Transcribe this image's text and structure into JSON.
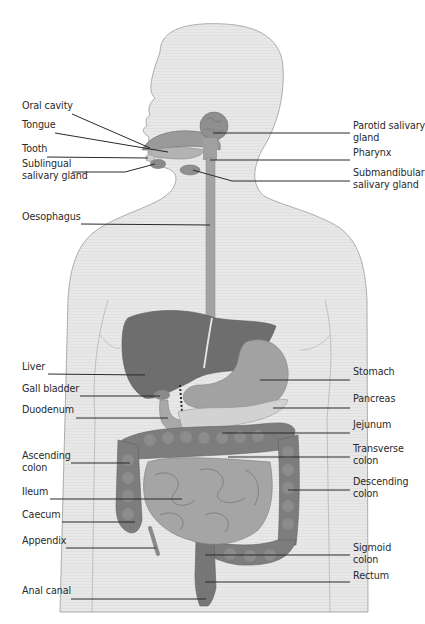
{
  "colors": {
    "background": "#ffffff",
    "body_silhouette": "#e6e6e6",
    "body_outline": "#9a9a9a",
    "organ_dark": "#6a6a6a",
    "organ_mid": "#8c8c8c",
    "organ_light": "#b0b0b0",
    "leader_line": "#2a2a2a",
    "label_text": "#2a2a2a"
  },
  "labels_left": [
    {
      "id": "oral-cavity",
      "text": "Oral cavity",
      "line2": "",
      "x": 22,
      "y": 108
    },
    {
      "id": "tongue",
      "text": "Tongue",
      "line2": "",
      "x": 22,
      "y": 127
    },
    {
      "id": "tooth",
      "text": "Tooth",
      "line2": "",
      "x": 22,
      "y": 151
    },
    {
      "id": "sublingual-salivary-gland",
      "text": "Sublingual",
      "line2": "salivary gland",
      "x": 22,
      "y": 166
    },
    {
      "id": "oesophagus",
      "text": "Oesophagus",
      "line2": "",
      "x": 22,
      "y": 219
    },
    {
      "id": "liver",
      "text": "Liver",
      "line2": "",
      "x": 22,
      "y": 369
    },
    {
      "id": "gall-bladder",
      "text": "Gall bladder",
      "line2": "",
      "x": 22,
      "y": 391
    },
    {
      "id": "duodenum",
      "text": "Duodenum",
      "line2": "",
      "x": 22,
      "y": 412
    },
    {
      "id": "ascending-colon",
      "text": "Ascending",
      "line2": "colon",
      "x": 22,
      "y": 458
    },
    {
      "id": "ileum",
      "text": "Ileum",
      "line2": "",
      "x": 22,
      "y": 494
    },
    {
      "id": "caecum",
      "text": "Caecum",
      "line2": "",
      "x": 22,
      "y": 517
    },
    {
      "id": "appendix",
      "text": "Appendix",
      "line2": "",
      "x": 22,
      "y": 543
    },
    {
      "id": "anal-canal",
      "text": "Anal canal",
      "line2": "",
      "x": 22,
      "y": 593
    }
  ],
  "labels_right": [
    {
      "id": "parotid-salivary-gland",
      "text": "Parotid salivary",
      "line2": "gland",
      "x": 353,
      "y": 128
    },
    {
      "id": "pharynx",
      "text": "Pharynx",
      "line2": "",
      "x": 353,
      "y": 155
    },
    {
      "id": "submandibular-salivary-gland",
      "text": "Submandibular",
      "line2": "salivary gland",
      "x": 353,
      "y": 175
    },
    {
      "id": "stomach",
      "text": "Stomach",
      "line2": "",
      "x": 353,
      "y": 374
    },
    {
      "id": "pancreas",
      "text": "Pancreas",
      "line2": "",
      "x": 353,
      "y": 401
    },
    {
      "id": "jejunum",
      "text": "Jejunum",
      "line2": "",
      "x": 353,
      "y": 427
    },
    {
      "id": "transverse-colon",
      "text": "Transverse",
      "line2": "colon",
      "x": 353,
      "y": 451
    },
    {
      "id": "descending-colon",
      "text": "Descending",
      "line2": "colon",
      "x": 353,
      "y": 484
    },
    {
      "id": "sigmoid-colon",
      "text": "Sigmoid",
      "line2": "colon",
      "x": 353,
      "y": 550
    },
    {
      "id": "rectum",
      "text": "Rectum",
      "line2": "",
      "x": 353,
      "y": 578
    }
  ]
}
